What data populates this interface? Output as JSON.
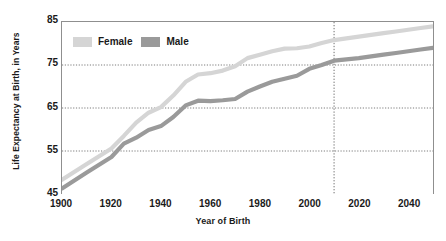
{
  "top_cutoff_text": "",
  "chart_data": {
    "type": "line",
    "title": "",
    "xlabel": "Year of Birth",
    "ylabel": "Life Expectancy at Birth, in Years",
    "xlim": [
      1900,
      2050
    ],
    "ylim": [
      45,
      85
    ],
    "xticks": [
      1900,
      1920,
      1940,
      1960,
      1980,
      2000,
      2020,
      2040
    ],
    "yticks": [
      45,
      55,
      65,
      75,
      85
    ],
    "grid": "horizontal-dotted",
    "legend_position": "top-left-inside",
    "x": [
      1900,
      1910,
      1920,
      1925,
      1930,
      1935,
      1940,
      1945,
      1950,
      1955,
      1960,
      1965,
      1970,
      1975,
      1980,
      1985,
      1990,
      1995,
      2000,
      2005,
      2010,
      2015,
      2020,
      2025,
      2030,
      2035,
      2040,
      2045,
      2050
    ],
    "series": [
      {
        "name": "Female",
        "color": "#d5d5d5",
        "values": [
          48.3,
          52.0,
          55.6,
          58.5,
          61.6,
          63.9,
          65.2,
          67.9,
          71.1,
          72.8,
          73.1,
          73.7,
          74.7,
          76.6,
          77.4,
          78.2,
          78.8,
          78.9,
          79.3,
          80.1,
          80.8,
          81.2,
          81.6,
          82.0,
          82.4,
          82.8,
          83.2,
          83.6,
          84.0
        ]
      },
      {
        "name": "Male",
        "color": "#9a9a9a",
        "values": [
          46.3,
          50.0,
          53.6,
          56.7,
          58.1,
          59.9,
          60.8,
          62.9,
          65.6,
          66.7,
          66.6,
          66.8,
          67.1,
          68.8,
          70.0,
          71.1,
          71.8,
          72.5,
          74.1,
          75.0,
          76.0,
          76.3,
          76.6,
          77.0,
          77.4,
          77.8,
          78.2,
          78.6,
          79.0
        ]
      }
    ],
    "annotations": [
      {
        "type": "vertical-dotted-line",
        "x": 2010,
        "label": ""
      }
    ]
  },
  "legend": {
    "items": [
      {
        "label": "Female",
        "color": "#d5d5d5"
      },
      {
        "label": "Male",
        "color": "#9a9a9a"
      }
    ]
  }
}
